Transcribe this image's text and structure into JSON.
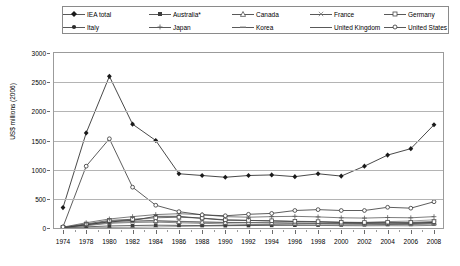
{
  "legend": {
    "position": "top",
    "items": [
      {
        "label": "IEA total",
        "marker": "diamond-filled",
        "color": "#1a1a1a"
      },
      {
        "label": "Australia*",
        "marker": "square-filled",
        "color": "#3d3d3d"
      },
      {
        "label": "Canada",
        "marker": "triangle-open",
        "color": "#555555"
      },
      {
        "label": "France",
        "marker": "cross",
        "color": "#7a7a7a"
      },
      {
        "label": "Germany",
        "marker": "square-open",
        "color": "#4a4a4a"
      },
      {
        "label": "Italy",
        "marker": "circle-filled",
        "color": "#2b2b2b"
      },
      {
        "label": "Japan",
        "marker": "plus",
        "color": "#5c5c5c"
      },
      {
        "label": "Korea",
        "marker": "dash",
        "color": "#8a8a8a"
      },
      {
        "label": "United Kingdom",
        "marker": "line",
        "color": "#6b6b6b"
      },
      {
        "label": "United States",
        "marker": "circle-open",
        "color": "#333333"
      }
    ]
  },
  "axes": {
    "ylabel": "US$ millions (2006)",
    "yticks": [
      "0",
      "500",
      "1000",
      "1500",
      "2000",
      "2500",
      "3000"
    ],
    "xticks": [
      "1974",
      "1978",
      "1980",
      "1982",
      "1984",
      "1986",
      "1988",
      "1990",
      "1992",
      "1994",
      "1996",
      "1998",
      "2000",
      "2002",
      "2004",
      "2006",
      "2008"
    ]
  },
  "chart_data": {
    "type": "line",
    "title": "",
    "xlabel": "",
    "ylabel": "US$ millions (2006)",
    "ylim": [
      0,
      3000
    ],
    "ytick_step": 500,
    "grid": true,
    "legend_position": "top",
    "x": [
      1974,
      1978,
      1980,
      1982,
      1984,
      1986,
      1988,
      1990,
      1992,
      1994,
      1996,
      1998,
      2000,
      2002,
      2004,
      2006,
      2008
    ],
    "series": [
      {
        "name": "IEA total",
        "marker": "diamond-filled",
        "color": "#1a1a1a",
        "values": [
          350,
          1630,
          2600,
          1780,
          1500,
          930,
          900,
          870,
          900,
          910,
          880,
          930,
          890,
          1060,
          1250,
          1360,
          1770
        ]
      },
      {
        "name": "United States",
        "marker": "circle-open",
        "color": "#333333",
        "values": [
          20,
          1060,
          1530,
          700,
          390,
          280,
          225,
          210,
          235,
          250,
          300,
          315,
          300,
          300,
          355,
          340,
          450
        ]
      },
      {
        "name": "Japan",
        "marker": "plus",
        "color": "#5c5c5c",
        "values": [
          15,
          90,
          155,
          195,
          230,
          245,
          230,
          195,
          185,
          195,
          200,
          190,
          175,
          170,
          180,
          175,
          195
        ]
      },
      {
        "name": "Germany",
        "marker": "square-open",
        "color": "#4a4a4a",
        "values": [
          12,
          70,
          130,
          150,
          175,
          185,
          170,
          140,
          130,
          125,
          115,
          110,
          100,
          95,
          100,
          95,
          110
        ]
      },
      {
        "name": "Italy",
        "marker": "circle-filled",
        "color": "#2b2b2b",
        "values": [
          8,
          55,
          105,
          130,
          200,
          200,
          165,
          135,
          130,
          120,
          110,
          105,
          95,
          85,
          90,
          85,
          95
        ]
      },
      {
        "name": "Canada",
        "marker": "triangle-open",
        "color": "#555555",
        "values": [
          10,
          60,
          115,
          140,
          125,
          110,
          100,
          95,
          95,
          90,
          85,
          80,
          78,
          80,
          85,
          80,
          90
        ]
      },
      {
        "name": "France",
        "marker": "cross",
        "color": "#7a7a7a",
        "values": [
          10,
          45,
          90,
          110,
          120,
          115,
          105,
          95,
          90,
          85,
          80,
          78,
          72,
          70,
          72,
          70,
          78
        ]
      },
      {
        "name": "United Kingdom",
        "marker": "line",
        "color": "#6b6b6b",
        "values": [
          8,
          40,
          80,
          95,
          100,
          90,
          80,
          70,
          62,
          55,
          48,
          45,
          40,
          38,
          40,
          38,
          45
        ]
      },
      {
        "name": "Australia*",
        "marker": "square-filled",
        "color": "#3d3d3d",
        "values": [
          5,
          20,
          35,
          42,
          48,
          45,
          42,
          40,
          42,
          45,
          48,
          50,
          52,
          55,
          60,
          62,
          70
        ]
      },
      {
        "name": "Korea",
        "marker": "dash",
        "color": "#8a8a8a",
        "values": [
          2,
          5,
          8,
          12,
          18,
          25,
          32,
          40,
          50,
          62,
          72,
          80,
          88,
          95,
          110,
          120,
          140
        ]
      }
    ]
  }
}
